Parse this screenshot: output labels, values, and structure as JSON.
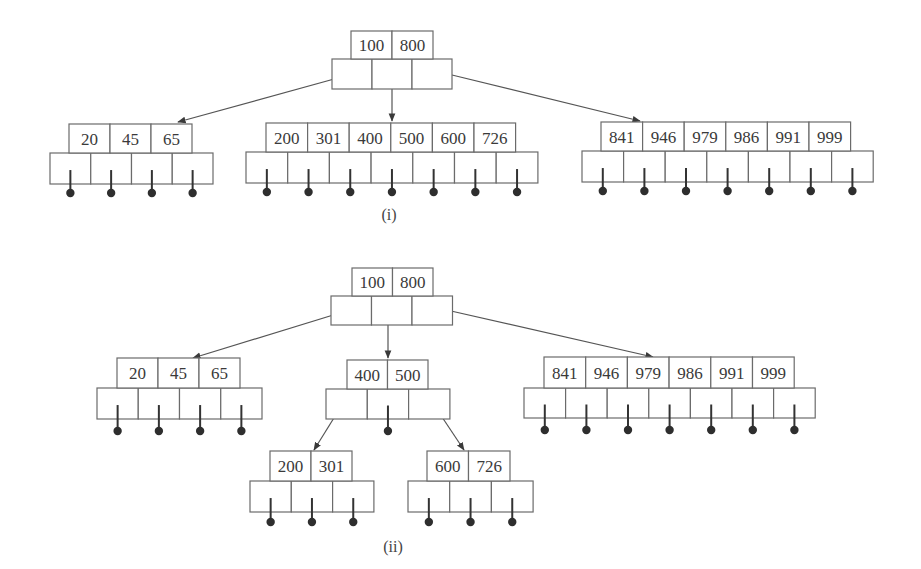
{
  "figure": {
    "colors": {
      "stroke": "#6b6b6b",
      "text": "#3a3a3a",
      "edge": "#555555",
      "dot": "#2e2e2e"
    }
  },
  "diagrams": [
    {
      "id": "i",
      "caption": "(i)",
      "caption_pos": [
        389,
        220
      ],
      "nodes": [
        {
          "id": "root",
          "keys": [
            "100",
            "800"
          ],
          "key_x": 351,
          "key_y": 31,
          "key_w": 41,
          "key_h": 28,
          "ptr_x": 332,
          "ptr_y": 59,
          "ptr_w": 40,
          "ptr_h": 30,
          "ptr_count": 3,
          "leaf": false
        },
        {
          "id": "leaf-left",
          "keys": [
            "20",
            "45",
            "65"
          ],
          "key_x": 69,
          "key_y": 124,
          "key_w": 41,
          "key_h": 29,
          "ptr_x": 50,
          "ptr_y": 153,
          "ptr_w": 40.75,
          "ptr_h": 31,
          "ptr_count": 4,
          "leaf": true,
          "dot_y": 193
        },
        {
          "id": "leaf-middle",
          "keys": [
            "200",
            "301",
            "400",
            "500",
            "600",
            "726"
          ],
          "key_x": 266,
          "key_y": 123,
          "key_w": 41.6,
          "key_h": 29,
          "ptr_x": 246,
          "ptr_y": 152,
          "ptr_w": 41.7,
          "ptr_h": 31,
          "ptr_count": 7,
          "leaf": true,
          "dot_y": 192
        },
        {
          "id": "leaf-right",
          "keys": [
            "841",
            "946",
            "979",
            "986",
            "991",
            "999"
          ],
          "key_x": 601,
          "key_y": 122,
          "key_w": 41.6,
          "key_h": 29,
          "ptr_x": 582,
          "ptr_y": 151,
          "ptr_w": 41.6,
          "ptr_h": 31,
          "ptr_count": 7,
          "leaf": true,
          "dot_y": 191
        }
      ],
      "edges": [
        {
          "from": [
            345,
            76
          ],
          "to": [
            178,
            122
          ]
        },
        {
          "from": [
            392,
            80
          ],
          "to": [
            392,
            121
          ]
        },
        {
          "from": [
            452,
            75
          ],
          "to": [
            640,
            121
          ]
        }
      ]
    },
    {
      "id": "ii",
      "caption": "(ii)",
      "caption_pos": [
        393,
        552
      ],
      "nodes": [
        {
          "id": "root",
          "keys": [
            "100",
            "800"
          ],
          "key_x": 352,
          "key_y": 268,
          "key_w": 40.5,
          "key_h": 28,
          "ptr_x": 331,
          "ptr_y": 296,
          "ptr_w": 40.5,
          "ptr_h": 29,
          "ptr_count": 3,
          "leaf": false
        },
        {
          "id": "leaf-left",
          "keys": [
            "20",
            "45",
            "65"
          ],
          "key_x": 117,
          "key_y": 358,
          "key_w": 41,
          "key_h": 30,
          "ptr_x": 97,
          "ptr_y": 388,
          "ptr_w": 41.25,
          "ptr_h": 31,
          "ptr_count": 4,
          "leaf": true,
          "dot_y": 431
        },
        {
          "id": "internal-middle",
          "keys": [
            "400",
            "500"
          ],
          "key_x": 347,
          "key_y": 360,
          "key_w": 40.5,
          "key_h": 29,
          "ptr_x": 326,
          "ptr_y": 389,
          "ptr_w": 41.3,
          "ptr_h": 30,
          "ptr_count": 3,
          "leaf": false,
          "center_dot": true,
          "dot_y": 431
        },
        {
          "id": "leaf-right",
          "keys": [
            "841",
            "946",
            "979",
            "986",
            "991",
            "999"
          ],
          "key_x": 544,
          "key_y": 357,
          "key_w": 41.7,
          "key_h": 31,
          "ptr_x": 524,
          "ptr_y": 388,
          "ptr_w": 41.6,
          "ptr_h": 30,
          "ptr_count": 7,
          "leaf": true,
          "dot_y": 430
        },
        {
          "id": "leaf-200-301",
          "keys": [
            "200",
            "301"
          ],
          "key_x": 270,
          "key_y": 451,
          "key_w": 41,
          "key_h": 30,
          "ptr_x": 250,
          "ptr_y": 481,
          "ptr_w": 41.3,
          "ptr_h": 31,
          "ptr_count": 3,
          "leaf": true,
          "dot_y": 522
        },
        {
          "id": "leaf-600-726",
          "keys": [
            "600",
            "726"
          ],
          "key_x": 427,
          "key_y": 451,
          "key_w": 41.5,
          "key_h": 30,
          "ptr_x": 408,
          "ptr_y": 481,
          "ptr_w": 41.7,
          "ptr_h": 31,
          "ptr_count": 3,
          "leaf": true,
          "dot_y": 522
        }
      ],
      "edges": [
        {
          "from": [
            343,
            312
          ],
          "to": [
            193,
            358
          ]
        },
        {
          "from": [
            388,
            316
          ],
          "to": [
            388,
            358
          ]
        },
        {
          "from": [
            451,
            311
          ],
          "to": [
            653,
            357
          ]
        },
        {
          "from": [
            342,
            405
          ],
          "to": [
            314,
            450
          ]
        },
        {
          "from": [
            434,
            405
          ],
          "to": [
            464,
            450
          ]
        }
      ]
    }
  ]
}
